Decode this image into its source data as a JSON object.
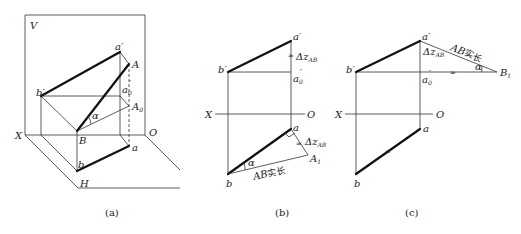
{
  "figure": {
    "panels": [
      {
        "id": "a",
        "caption": "(a)",
        "labels": {
          "V": "V",
          "X": "X",
          "O": "O",
          "H": "H",
          "a_prime": "a′",
          "A": "A",
          "b_prime": "b′",
          "a0_prime": "a",
          "a0_prime_sub": "0",
          "a0_prime_sup": "′",
          "A0": "A",
          "A0_sub": "0",
          "alpha": "α",
          "B": "B",
          "a": "a",
          "b": "b"
        }
      },
      {
        "id": "b",
        "caption": "(b)",
        "labels": {
          "a_prime": "a′",
          "b_prime": "b′",
          "dz": "Δz",
          "dz_sub": "AB",
          "a0_prime": "a",
          "a0_prime_sub": "0",
          "a0_prime_sup": "′",
          "X": "X",
          "O": "O",
          "a": "a",
          "dz2": "Δz",
          "dz2_sub": "AB",
          "A1": "A",
          "A1_sub": "1",
          "alpha": "α",
          "true_length_italic": "AB",
          "true_length_cjk": "实长",
          "b": "b"
        }
      },
      {
        "id": "c",
        "caption": "(c)",
        "labels": {
          "a_prime": "a′",
          "b_prime": "b′",
          "dz": "Δz",
          "dz_sub": "AB",
          "true_length_italic": "AB",
          "true_length_cjk": "实长",
          "alpha": "α",
          "B1": "B",
          "B1_sub": "1",
          "a0_prime": "a",
          "a0_prime_sub": "0",
          "a0_prime_sup": "′",
          "X": "X",
          "O": "O",
          "a": "a",
          "b": "b"
        }
      }
    ]
  }
}
